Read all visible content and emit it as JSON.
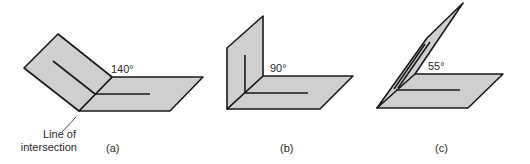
{
  "figure": {
    "panels": [
      {
        "id": "a",
        "caption": "(a)",
        "angle_label": "140°",
        "angle_deg": 140
      },
      {
        "id": "b",
        "caption": "(b)",
        "angle_label": "90°",
        "angle_deg": 90
      },
      {
        "id": "c",
        "caption": "(c)",
        "angle_label": "55°",
        "angle_deg": 55
      }
    ],
    "annotation": {
      "line1": "Line of",
      "line2": "intersection"
    },
    "colors": {
      "plane_fill": "#cfcfcf",
      "stroke": "#1a1a1a",
      "text": "#2a2a2a"
    }
  }
}
